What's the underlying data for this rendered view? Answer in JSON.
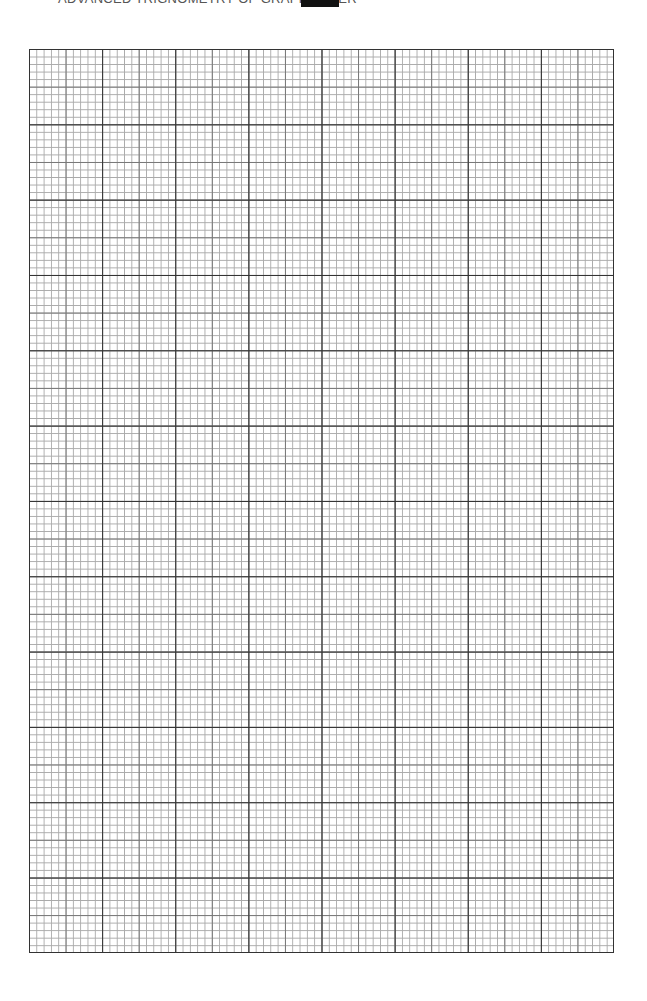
{
  "header": {
    "title": "ADVANCED TRIGNOMETRY OF GRAPH PAPER",
    "tag_box": ""
  },
  "grid": {
    "major_columns": 8,
    "major_rows": 12,
    "minor_per_major": 10,
    "line_color_major": "#333333",
    "line_color_medium": "#777777",
    "line_color_minor": "#aaaaaa"
  }
}
